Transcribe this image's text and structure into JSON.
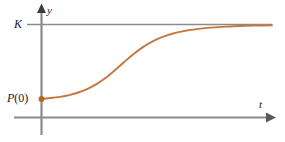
{
  "figure": {
    "axes": {
      "y_axis_label": "y",
      "t_axis_label": "t"
    },
    "labels": {
      "carrying_capacity": "K",
      "initial_population_prefix": "P",
      "initial_population_arg": "(0)",
      "initial_population": "P(0)"
    },
    "colors": {
      "curve": "#c4783f",
      "axis": "#8a8a8a",
      "asymptote": "#8a8a8a",
      "point": "#b5651d",
      "text": "#1a1a1a",
      "background": "#ffffff"
    }
  },
  "chart_data": {
    "type": "line",
    "title": "",
    "xlabel": "t",
    "ylabel": "y",
    "grid": false,
    "legend": false,
    "xlim": [
      0,
      10
    ],
    "ylim": [
      0,
      1.12
    ],
    "annotations": [
      {
        "text": "K",
        "kind": "asymptote-label",
        "y": 1.0
      },
      {
        "text": "P(0)",
        "kind": "point-label",
        "x": 0,
        "y": 0.2
      }
    ],
    "reference_lines": [
      {
        "name": "carrying-capacity",
        "orientation": "horizontal",
        "y": 1.0,
        "label": "K"
      }
    ],
    "markers": [
      {
        "name": "initial-value-point",
        "x": 0,
        "y": 0.2,
        "label": "P(0)"
      }
    ],
    "series": [
      {
        "name": "logistic-growth",
        "x": [
          0.0,
          0.4,
          0.8,
          1.2,
          1.6,
          2.0,
          2.4,
          2.8,
          3.2,
          3.6,
          4.0,
          4.4,
          4.8,
          5.2,
          5.6,
          6.0,
          6.4,
          6.8,
          7.2,
          7.6,
          8.0,
          8.6,
          9.2,
          10.0
        ],
        "y": [
          0.2,
          0.209,
          0.222,
          0.241,
          0.269,
          0.308,
          0.361,
          0.43,
          0.512,
          0.6,
          0.684,
          0.757,
          0.816,
          0.861,
          0.895,
          0.921,
          0.939,
          0.953,
          0.964,
          0.971,
          0.977,
          0.984,
          0.988,
          0.992
        ]
      }
    ]
  }
}
